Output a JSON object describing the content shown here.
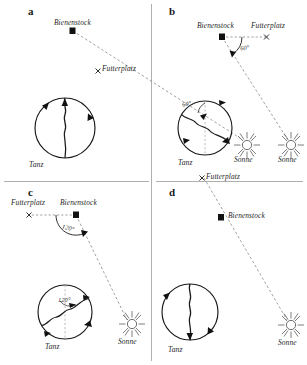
{
  "figure": {
    "title_letters": [
      "a",
      "b",
      "c",
      "d"
    ],
    "terms": {
      "hive": "Bienenstock",
      "feeding_place": "Futterplatz",
      "sun": "Sonne",
      "dance": "Tanz"
    },
    "marker_glyphs": {
      "hive_marker": "square-marker",
      "feeding_marker": "x-marker",
      "sun_marker": "sun-rays-icon"
    },
    "colors": {
      "ink": "#1a1a1a",
      "line": "#2a2a2a",
      "dashed": "#6a6a6a",
      "divider": "#9a9a9a"
    }
  },
  "panels": [
    {
      "letter": "a",
      "hive_label": "Bienenstock",
      "feeding_label": "Futterplatz",
      "sun_label": "Sonne",
      "dance_label": "Tanz",
      "angle_label": "",
      "angle_degrees": 0,
      "description": "Feeding place lies directly toward the sun; waggle run points straight up"
    },
    {
      "letter": "b",
      "hive_label": "Bienenstock",
      "feeding_label": "Futterplatz",
      "sun_label": "Sonne",
      "dance_label": "Tanz",
      "angle_label": "60°",
      "angle_degrees": 60,
      "description": "Feeding place 60 degrees left of the sun; waggle run tilted 60 degrees"
    },
    {
      "letter": "c",
      "hive_label": "Bienenstock",
      "feeding_label": "Futterplatz",
      "sun_label": "Sonne",
      "dance_label": "Tanz",
      "angle_label": "120°",
      "angle_degrees": 120,
      "description": "Feeding place 120 degrees from the sun; waggle run tilted 120 degrees"
    },
    {
      "letter": "d",
      "hive_label": "Bienenstock",
      "feeding_label": "Futterplatz",
      "sun_label": "Sonne",
      "dance_label": "Tanz",
      "angle_label": "",
      "angle_degrees": 180,
      "description": "Feeding place opposite the sun; waggle run points straight down"
    }
  ]
}
